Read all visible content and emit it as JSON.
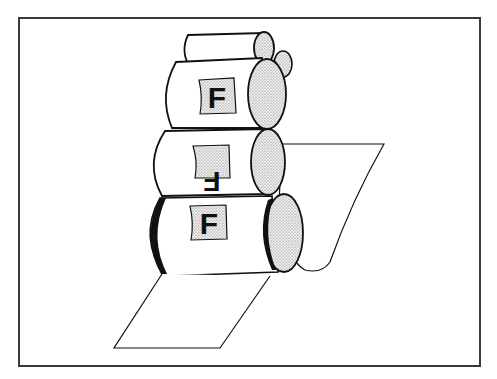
{
  "diagram": {
    "colors": {
      "line": "#111111",
      "frame": "#3a3a3a",
      "stipple_bg": "#e8e8e8",
      "stipple_dot": "#8a8a8a",
      "paper": "#ffffff"
    },
    "rollers": [
      {
        "id": "ink-roller-top",
        "label": ""
      },
      {
        "id": "ink-roller-small",
        "label": ""
      },
      {
        "id": "plate-cylinder",
        "label": "F"
      },
      {
        "id": "blanket-cylinder",
        "label": "F",
        "orientation": "rotated-180"
      },
      {
        "id": "impression-cylinder",
        "label": "F"
      }
    ],
    "paper": {
      "id": "paper-web",
      "label": ""
    }
  }
}
